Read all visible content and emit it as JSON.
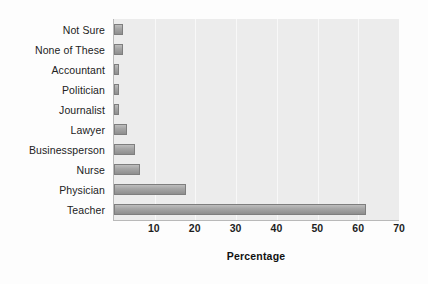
{
  "chart_data": {
    "type": "bar",
    "orientation": "horizontal",
    "title": "",
    "xlabel": "Percentage",
    "ylabel": "",
    "xlim": [
      0,
      70
    ],
    "xticks": [
      0,
      10,
      20,
      30,
      40,
      50,
      60,
      70
    ],
    "xtick_labels": [
      "",
      "10",
      "20",
      "30",
      "40",
      "50",
      "60",
      "70"
    ],
    "grid": true,
    "legend": null,
    "categories": [
      "Not Sure",
      "None of These",
      "Accountant",
      "Politician",
      "Journalist",
      "Lawyer",
      "Businessperson",
      "Nurse",
      "Physician",
      "Teacher"
    ],
    "values": [
      2.2,
      2.2,
      1.2,
      1.3,
      1.2,
      3.2,
      5.2,
      6.5,
      17.7,
      61.8
    ],
    "bar_color": "#a6a6a6",
    "plot_background": "#ececec",
    "gridline_color": "#f8f8f8",
    "axis_color": "#b9b9b9"
  }
}
